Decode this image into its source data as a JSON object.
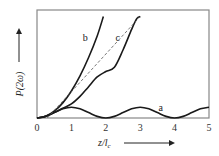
{
  "chart_data": {
    "type": "line",
    "title": "",
    "xlabel": "z/l_c",
    "ylabel": "P(2ω)",
    "xlim": [
      0,
      5
    ],
    "ylim": [
      0,
      10
    ],
    "xticks": [
      "0",
      "1",
      "2",
      "3",
      "4",
      "5"
    ],
    "yticks": [],
    "grid": false,
    "legend": "inline curve labels",
    "series": [
      {
        "name": "a",
        "style": "solid",
        "x": [
          0,
          0.25,
          0.5,
          0.75,
          1,
          1.25,
          1.5,
          1.75,
          2,
          2.25,
          2.5,
          2.75,
          3,
          3.25,
          3.5,
          3.75,
          4,
          4.25,
          4.5,
          4.75,
          5
        ],
        "y": [
          0,
          0.15,
          0.5,
          0.85,
          1.0,
          0.85,
          0.5,
          0.15,
          0,
          0.15,
          0.5,
          0.85,
          1.0,
          0.85,
          0.5,
          0.15,
          0,
          0.15,
          0.5,
          0.85,
          1.0
        ]
      },
      {
        "name": "b",
        "style": "solid",
        "x": [
          0,
          0.25,
          0.5,
          0.75,
          1,
          1.25,
          1.5,
          1.75,
          1.93
        ],
        "y": [
          0,
          0.16,
          0.63,
          1.4,
          2.5,
          3.9,
          5.6,
          7.6,
          9.4
        ]
      },
      {
        "name": "c",
        "style": "solid",
        "x": [
          0,
          0.25,
          0.5,
          0.75,
          1,
          1.25,
          1.5,
          1.75,
          2,
          2.25,
          2.5,
          2.75,
          2.9,
          3.0
        ],
        "y": [
          0,
          0.15,
          0.5,
          0.9,
          1.3,
          2.0,
          2.9,
          3.8,
          4.3,
          4.7,
          6.3,
          8.2,
          9.2,
          9.4
        ]
      },
      {
        "name": "c-average",
        "style": "dashed",
        "x": [
          0.3,
          3.0
        ],
        "y": [
          0,
          9.4
        ]
      }
    ],
    "annotations": [
      {
        "text": "a",
        "x": 3.6,
        "y": 0.9
      },
      {
        "text": "b",
        "x": 1.4,
        "y": 7.4
      },
      {
        "text": "c",
        "x": 2.35,
        "y": 7.4
      }
    ]
  },
  "axes": {
    "x_label_main": "z/l",
    "x_label_sub": "c",
    "y_label": "P(2ω)"
  }
}
